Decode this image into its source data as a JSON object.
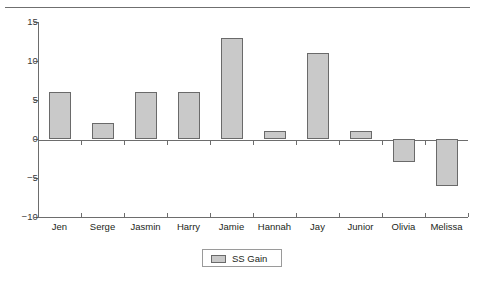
{
  "chart_data": {
    "type": "bar",
    "title": "",
    "subtitle": "",
    "xlabel": "",
    "ylabel": "",
    "categories": [
      "Jen",
      "Serge",
      "Jasmin",
      "Harry",
      "Jamie",
      "Hannah",
      "Jay",
      "Junior",
      "Olivia",
      "Melissa"
    ],
    "values": [
      6,
      2,
      6,
      6,
      13,
      1,
      11,
      1,
      -3,
      -6
    ],
    "series": [
      {
        "name": "SS Gain",
        "values": [
          6,
          2,
          6,
          6,
          13,
          1,
          11,
          1,
          -3,
          -6
        ]
      }
    ],
    "ylim": [
      -10,
      15
    ],
    "yticks": [
      15,
      10,
      5,
      0,
      -5,
      -10
    ],
    "ytick_labels": [
      "15",
      "10",
      "5",
      "0",
      "−5",
      "−10"
    ],
    "grid": false,
    "legend": {
      "position": "bottom-center",
      "entries": [
        {
          "label": "SS Gain",
          "color": "#c9c9c9"
        }
      ]
    },
    "colors": {
      "bar_fill": "#c9c9c9",
      "bar_border": "#6a6a6a",
      "axis": "#6d6d6d",
      "text": "#231f20",
      "background": "#ffffff"
    }
  }
}
